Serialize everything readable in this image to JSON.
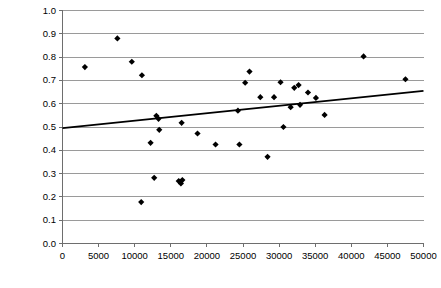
{
  "chart_data": {
    "type": "scatter",
    "title": "",
    "subtitle": "",
    "xlabel": "",
    "ylabel": "",
    "grid": "horizontal",
    "legend": "none",
    "xlim": [
      0,
      50000
    ],
    "ylim": [
      0.0,
      1.0
    ],
    "xticks": [
      0,
      5000,
      10000,
      15000,
      20000,
      25000,
      30000,
      35000,
      40000,
      45000,
      50000
    ],
    "xtick_labels": [
      "0",
      "5000",
      "10000",
      "15000",
      "20000",
      "25000",
      "30000",
      "35000",
      "40000",
      "45000",
      "50000"
    ],
    "yticks": [
      0.0,
      0.1,
      0.2,
      0.3,
      0.4,
      0.5,
      0.6,
      0.7,
      0.8,
      0.9,
      1.0
    ],
    "ytick_labels": [
      "0.0",
      "0.1",
      "0.2",
      "0.3",
      "0.4",
      "0.5",
      "0.6",
      "0.7",
      "0.8",
      "0.9",
      "1.0"
    ],
    "marker": "diamond",
    "marker_color": "#000000",
    "marker_size": 5,
    "points": [
      {
        "x": 3100,
        "y": 0.757
      },
      {
        "x": 7600,
        "y": 0.88
      },
      {
        "x": 9600,
        "y": 0.78
      },
      {
        "x": 11000,
        "y": 0.722
      },
      {
        "x": 10900,
        "y": 0.178
      },
      {
        "x": 12200,
        "y": 0.432
      },
      {
        "x": 12700,
        "y": 0.282
      },
      {
        "x": 13000,
        "y": 0.548
      },
      {
        "x": 13300,
        "y": 0.535
      },
      {
        "x": 13400,
        "y": 0.488
      },
      {
        "x": 16100,
        "y": 0.268
      },
      {
        "x": 16400,
        "y": 0.258
      },
      {
        "x": 16600,
        "y": 0.272
      },
      {
        "x": 16500,
        "y": 0.518
      },
      {
        "x": 18700,
        "y": 0.472
      },
      {
        "x": 21200,
        "y": 0.425
      },
      {
        "x": 24300,
        "y": 0.57
      },
      {
        "x": 24500,
        "y": 0.425
      },
      {
        "x": 25300,
        "y": 0.69
      },
      {
        "x": 25900,
        "y": 0.738
      },
      {
        "x": 27400,
        "y": 0.628
      },
      {
        "x": 28400,
        "y": 0.372
      },
      {
        "x": 29300,
        "y": 0.628
      },
      {
        "x": 30200,
        "y": 0.692
      },
      {
        "x": 30600,
        "y": 0.5
      },
      {
        "x": 31600,
        "y": 0.585
      },
      {
        "x": 32100,
        "y": 0.668
      },
      {
        "x": 32700,
        "y": 0.68
      },
      {
        "x": 32900,
        "y": 0.595
      },
      {
        "x": 34000,
        "y": 0.648
      },
      {
        "x": 35100,
        "y": 0.625
      },
      {
        "x": 36300,
        "y": 0.552
      },
      {
        "x": 41700,
        "y": 0.803
      },
      {
        "x": 47500,
        "y": 0.705
      }
    ],
    "trendline": {
      "visible": true,
      "color": "#000000",
      "x_start": 0,
      "y_start": 0.495,
      "x_end": 50000,
      "y_end": 0.655
    }
  }
}
